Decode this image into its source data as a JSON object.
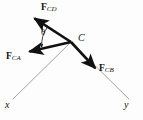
{
  "figure": {
    "type": "force-vector-diagram",
    "background_color": "#fdfdfd",
    "stroke_color": "#111111",
    "axis_color": "#9a9a9a",
    "width": 143,
    "height": 120,
    "origin_point": {
      "label": "C",
      "x": 71,
      "y": 42
    },
    "vectors": [
      {
        "name": "F_CD",
        "label_bold": "F",
        "label_sub": "CD",
        "from_x": 71,
        "from_y": 42,
        "to_x": 33,
        "to_y": 17,
        "style": "solid-thick-arrow"
      },
      {
        "name": "F_CA",
        "label_bold": "F",
        "label_sub": "CA",
        "from_x": 71,
        "from_y": 42,
        "to_x": 27,
        "to_y": 52,
        "style": "solid-thick-arrow"
      },
      {
        "name": "F_CB",
        "label_bold": "F",
        "label_sub": "CB",
        "from_x": 71,
        "from_y": 42,
        "to_x": 97,
        "to_y": 70,
        "style": "solid-thick-arrow"
      }
    ],
    "axes": [
      {
        "name": "x-axis",
        "label": "x",
        "from_x": 71,
        "from_y": 42,
        "to_x": 13,
        "to_y": 99,
        "style": "thin-line"
      },
      {
        "name": "y-axis",
        "label": "y",
        "from_x": 71,
        "from_y": 42,
        "to_x": 129,
        "to_y": 99,
        "style": "thin-line"
      }
    ],
    "angle": {
      "symbol": "θ",
      "between": [
        "F_CD",
        "F_CA"
      ],
      "vertex": "C",
      "arc_radius": 30
    },
    "labels": {
      "fcd_bold": "F",
      "fcd_sub": "CD",
      "fca_bold": "F",
      "fca_sub": "CA",
      "fcb_bold": "F",
      "fcb_sub": "CB",
      "point_c": "C",
      "axis_x": "x",
      "axis_y": "y",
      "theta": "θ"
    }
  }
}
